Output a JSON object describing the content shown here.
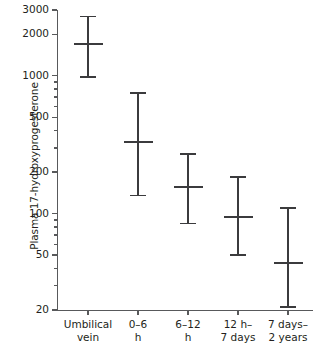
{
  "chart_data": {
    "type": "scatter",
    "title": "",
    "xlabel": "",
    "ylabel": "Plasma 17-hydroxyprogesterone",
    "yscale": "log",
    "ylim": [
      20,
      3000
    ],
    "grid": false,
    "legend": null,
    "ytick_labels": [
      "3000",
      "2000",
      "1000",
      "500",
      "200",
      "100",
      "50",
      "20"
    ],
    "ytick_values": [
      3000,
      2000,
      1000,
      500,
      200,
      100,
      50,
      20
    ],
    "yminor_tick_values": [
      900,
      800,
      700,
      600,
      400,
      300,
      90,
      80,
      70,
      60,
      40,
      30
    ],
    "categories": [
      "Umbilical\nvein",
      "0–6\nh",
      "6–12\nh",
      "12 h–\n7 days",
      "7 days–\n2 years"
    ],
    "points": [
      {
        "category": "Umbilical vein",
        "median": 1700,
        "low": 980,
        "high": 2700
      },
      {
        "category": "0–6 h",
        "median": 330,
        "low": 135,
        "high": 750
      },
      {
        "category": "6–12 h",
        "median": 155,
        "low": 85,
        "high": 270
      },
      {
        "category": "12 h–7 days",
        "median": 95,
        "low": 50,
        "high": 185
      },
      {
        "category": "7 days–2 years",
        "median": 44,
        "low": 21,
        "high": 110
      }
    ],
    "marker_style": "median-bar-with-range-whiskers",
    "colors": {
      "axis": "#58595b",
      "marker": "#3b3b3d",
      "background": "#ffffff"
    }
  }
}
